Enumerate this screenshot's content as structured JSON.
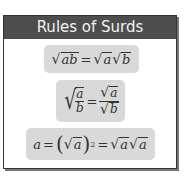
{
  "title": "Rules of Surds",
  "colors": {
    "header_bg": "#4d4d4d",
    "header_text": "#f2f2f2",
    "pill_bg": "#d9d9d9",
    "border": "#333333"
  },
  "rules": [
    {
      "id": "product",
      "lhs_radicand": "ab",
      "rhs": [
        "a",
        "b"
      ]
    },
    {
      "id": "quotient",
      "num": "a",
      "den": "b"
    },
    {
      "id": "square",
      "var": "a",
      "exponent": "2"
    }
  ],
  "symbols": {
    "eq": "=",
    "sqrt": "√",
    "lparen": "(",
    "rparen": ")"
  }
}
